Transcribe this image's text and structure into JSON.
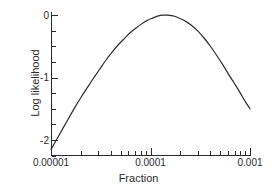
{
  "chart_data": {
    "type": "line",
    "title": "",
    "xlabel": "Fraction",
    "ylabel": "Log likelihood",
    "xscale": "log",
    "yscale": "linear",
    "xlim": [
      1e-05,
      0.001
    ],
    "ylim": [
      -2.25,
      0.05
    ],
    "grid": false,
    "legend": null,
    "x_tick_labels": [
      "0.00001",
      "0.0001",
      "0.001"
    ],
    "x_tick_values": [
      1e-05,
      0.0001,
      0.001
    ],
    "x_minor_ticks": [
      2e-05,
      3e-05,
      4e-05,
      5e-05,
      6e-05,
      7e-05,
      8e-05,
      9e-05,
      0.0002,
      0.0003,
      0.0004,
      0.0005,
      0.0006,
      0.0007,
      0.0008,
      0.0009
    ],
    "y_tick_labels": [
      "0",
      "-1",
      "-2"
    ],
    "y_tick_values": [
      0,
      -1,
      -2
    ],
    "y_minor_ticks": [
      -0.25,
      -0.5,
      -0.75,
      -1.25,
      -1.5,
      -1.75,
      -2.25
    ],
    "series": [
      {
        "name": "Log likelihood",
        "color": "#2b2b2b",
        "linewidth": 1.2,
        "x": [
          1e-05,
          1.15e-05,
          1.32e-05,
          1.52e-05,
          1.75e-05,
          2e-05,
          2.3e-05,
          2.65e-05,
          3.05e-05,
          3.5e-05,
          4e-05,
          4.6e-05,
          5.29e-05,
          6.08e-05,
          7e-05,
          8e-05,
          9.2e-05,
          0.000105,
          0.00012,
          0.000132,
          0.00015,
          0.000175,
          0.0002,
          0.00023,
          0.000265,
          0.000305,
          0.00035,
          0.0004,
          0.00046,
          0.00053,
          0.00061,
          0.0007,
          0.0008,
          0.0009,
          0.001
        ],
        "y": [
          -2.15,
          -1.98,
          -1.81,
          -1.64,
          -1.47,
          -1.32,
          -1.17,
          -1.02,
          -0.88,
          -0.74,
          -0.62,
          -0.5,
          -0.4,
          -0.3,
          -0.22,
          -0.15,
          -0.09,
          -0.05,
          -0.015,
          -0.003,
          -0.002,
          -0.02,
          -0.06,
          -0.11,
          -0.18,
          -0.27,
          -0.38,
          -0.5,
          -0.64,
          -0.79,
          -0.95,
          -1.1,
          -1.25,
          -1.39,
          -1.5
        ]
      }
    ],
    "annotations": []
  },
  "axes": {
    "x_title": "Fraction",
    "y_title": "Log likelihood"
  },
  "style": {
    "background": "#ffffff",
    "axis_color": "#2b2b2b",
    "line_color": "#2b2b2b"
  }
}
